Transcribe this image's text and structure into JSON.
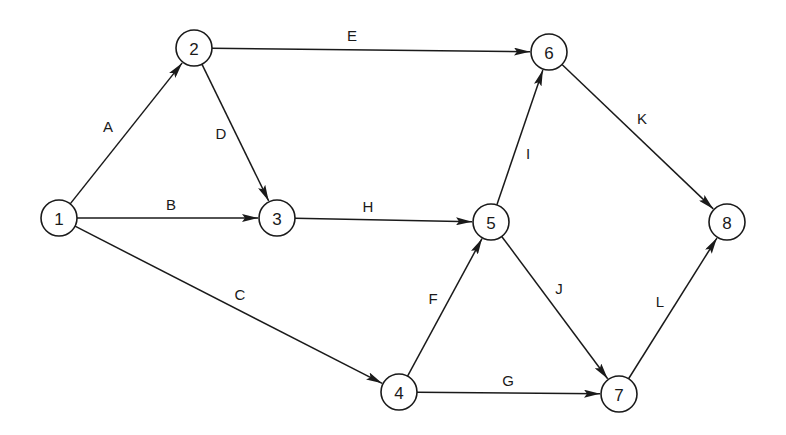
{
  "diagram": {
    "type": "activity-on-arrow network",
    "node_radius": 18,
    "colors": {
      "stroke": "#1a1a1a",
      "background": "#ffffff"
    },
    "nodes": [
      {
        "id": "1",
        "label": "1",
        "x": 59,
        "y": 218
      },
      {
        "id": "2",
        "label": "2",
        "x": 194,
        "y": 48
      },
      {
        "id": "3",
        "label": "3",
        "x": 277,
        "y": 218
      },
      {
        "id": "4",
        "label": "4",
        "x": 399,
        "y": 392
      },
      {
        "id": "5",
        "label": "5",
        "x": 491,
        "y": 222
      },
      {
        "id": "6",
        "label": "6",
        "x": 549,
        "y": 52
      },
      {
        "id": "7",
        "label": "7",
        "x": 619,
        "y": 394
      },
      {
        "id": "8",
        "label": "8",
        "x": 727,
        "y": 222
      }
    ],
    "edges": [
      {
        "label": "A",
        "from": "1",
        "to": "2",
        "lx": 108,
        "ly": 126
      },
      {
        "label": "B",
        "from": "1",
        "to": "3",
        "lx": 171,
        "ly": 204
      },
      {
        "label": "C",
        "from": "1",
        "to": "4",
        "lx": 240,
        "ly": 294
      },
      {
        "label": "D",
        "from": "2",
        "to": "3",
        "lx": 221,
        "ly": 133
      },
      {
        "label": "E",
        "from": "2",
        "to": "6",
        "lx": 352,
        "ly": 35
      },
      {
        "label": "H",
        "from": "3",
        "to": "5",
        "lx": 368,
        "ly": 206
      },
      {
        "label": "F",
        "from": "4",
        "to": "5",
        "lx": 433,
        "ly": 298
      },
      {
        "label": "G",
        "from": "4",
        "to": "7",
        "lx": 508,
        "ly": 380
      },
      {
        "label": "I",
        "from": "5",
        "to": "6",
        "lx": 528,
        "ly": 153
      },
      {
        "label": "J",
        "from": "5",
        "to": "7",
        "lx": 559,
        "ly": 288
      },
      {
        "label": "K",
        "from": "6",
        "to": "8",
        "lx": 642,
        "ly": 118
      },
      {
        "label": "L",
        "from": "7",
        "to": "8",
        "lx": 660,
        "ly": 301
      }
    ]
  }
}
